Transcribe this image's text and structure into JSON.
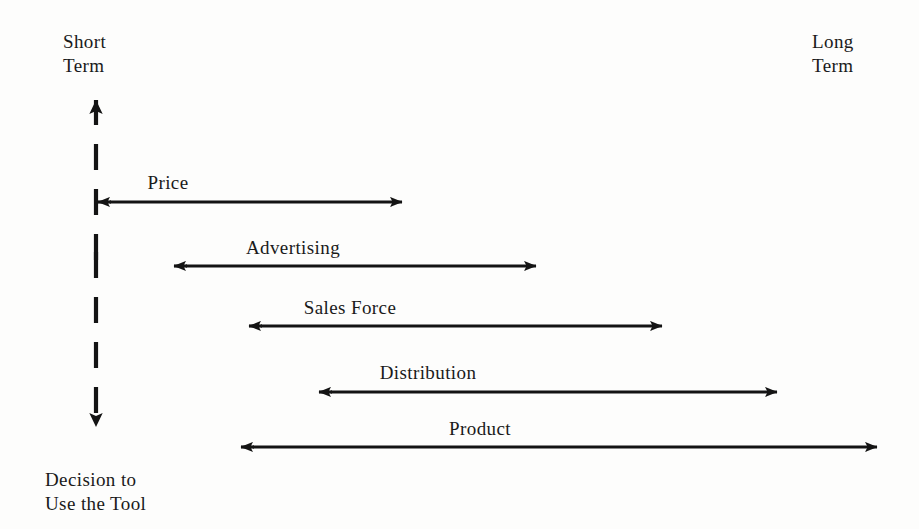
{
  "figure": {
    "type": "timeline-arrow-diagram",
    "background_color": "#fdfdfc",
    "ink_color": "#1a1a1a"
  },
  "axes": {
    "vertical": {
      "name": "decision-axis",
      "style": "dashed double-headed vertical arrow",
      "top_label": "Short\nTerm",
      "bottom_label": "Decision to\nUse the Tool",
      "x": 96,
      "y_top": 86,
      "y_bottom": 441
    },
    "horizontal": {
      "name": "time-horizon-axis",
      "right_label": "Long\nTerm"
    }
  },
  "labels": {
    "short_term": "Short\nTerm",
    "long_term": "Long\nTerm",
    "decision_to_use_the_tool": "Decision to\nUse the Tool"
  },
  "chart_data": {
    "type": "bar",
    "title": "",
    "subtitle": "",
    "xlabel": "",
    "ylabel": "",
    "grid": false,
    "legend": "none",
    "axis_annotations": {
      "left_top": "Short Term",
      "left_bottom": "Decision to Use the Tool",
      "right_top": "Long Term"
    },
    "categories": [
      "Price",
      "Advertising",
      "Sales Force",
      "Distribution",
      "Product"
    ],
    "series": [
      {
        "name": "Response time range (pixel span of double-headed arrow)",
        "segments": [
          {
            "label": "Price",
            "x_start": 97,
            "x_end": 403,
            "y": 202
          },
          {
            "label": "Advertising",
            "x_start": 173,
            "x_end": 537,
            "y": 266
          },
          {
            "label": "Sales Force",
            "x_start": 248,
            "x_end": 663,
            "y": 326
          },
          {
            "label": "Distribution",
            "x_start": 318,
            "x_end": 778,
            "y": 392
          },
          {
            "label": "Product",
            "x_start": 240,
            "x_end": 878,
            "y": 447
          }
        ]
      }
    ]
  },
  "arrows": [
    {
      "name": "price-arrow",
      "label": "Price",
      "x_start": 97,
      "x_end": 403,
      "y": 202,
      "label_x": 168,
      "label_y": 172
    },
    {
      "name": "advertising-arrow",
      "label": "Advertising",
      "x_start": 173,
      "x_end": 537,
      "y": 266,
      "label_x": 293,
      "label_y": 237
    },
    {
      "name": "sales-force-arrow",
      "label": "Sales Force",
      "x_start": 248,
      "x_end": 663,
      "y": 326,
      "label_x": 350,
      "label_y": 297
    },
    {
      "name": "distribution-arrow",
      "label": "Distribution",
      "x_start": 318,
      "x_end": 778,
      "y": 392,
      "label_x": 428,
      "label_y": 362
    },
    {
      "name": "product-arrow",
      "label": "Product",
      "x_start": 240,
      "x_end": 878,
      "y": 447,
      "label_x": 480,
      "label_y": 418
    }
  ]
}
